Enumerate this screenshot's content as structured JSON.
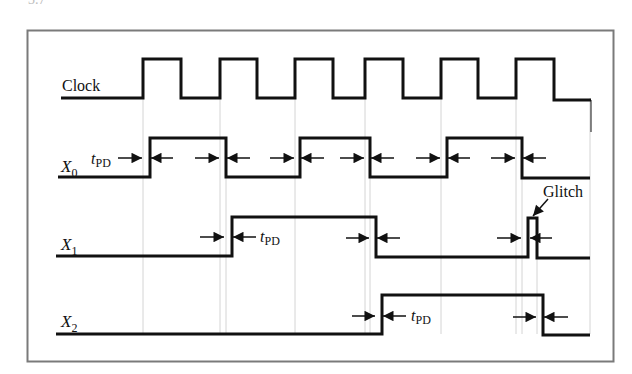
{
  "figure": {
    "top_label": "3.7"
  },
  "signals": [
    {
      "name": "Clock",
      "label_main": "Clock",
      "label_sub": ""
    },
    {
      "name": "X0",
      "label_main": "X",
      "label_sub": "0"
    },
    {
      "name": "X1",
      "label_main": "X",
      "label_sub": "1"
    },
    {
      "name": "X2",
      "label_main": "X",
      "label_sub": "2"
    }
  ],
  "annotations": {
    "tpd_main": "t",
    "tpd_sub": "PD",
    "glitch": "Glitch"
  },
  "colors": {
    "waveform": "#111111",
    "border": "#7a7a7a",
    "guide": "#d4d4d4"
  }
}
